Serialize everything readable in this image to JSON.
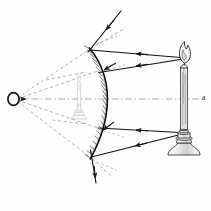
{
  "figure": {
    "background_color": "#fefefe",
    "ink_color": "#1a1a1a",
    "construction_color": "#8a8a8a",
    "ghost_color": "#b9b9b9"
  },
  "labels": {
    "axis_right": "a",
    "convergence_point": "O"
  },
  "objects": {
    "candle": {
      "name": "candle",
      "position": "right",
      "flame": {
        "center_x": 184,
        "center_y": 54
      },
      "body": {
        "top_y": 62,
        "bottom_y": 132,
        "center_x": 184
      },
      "holder": {
        "top_y": 130,
        "bottom_y": 155,
        "center_x": 184
      }
    },
    "mirror": {
      "name": "concave-mirror",
      "type": "concave",
      "vertex": {
        "x": 110,
        "y": 99
      },
      "top_edge": {
        "x": 89,
        "y": 48
      },
      "bottom_edge": {
        "x": 90,
        "y": 160
      },
      "hatching": "back-surface"
    },
    "image": {
      "name": "inverted-candle-image",
      "orientation": "inverted",
      "center_x": 79,
      "top_y": 70,
      "bottom_y": 120
    },
    "focus_point": {
      "x": 14,
      "y": 99
    }
  },
  "rays": {
    "incident_upper": {
      "from_x": 181,
      "from_y": 58,
      "to_x": 90,
      "to_y": 50
    },
    "incident_lower_upper": {
      "from_x": 181,
      "from_y": 60,
      "to_x": 98,
      "to_y": 72
    },
    "incident_lower": {
      "from_x": 180,
      "from_y": 133,
      "to_x": 97,
      "to_y": 127
    },
    "incident_bottom": {
      "from_x": 181,
      "from_y": 135,
      "to_x": 91,
      "to_y": 157
    },
    "external_top": {
      "from_x": 121,
      "from_y": 10,
      "to_x": 88,
      "to_y": 52
    },
    "external_bottom": {
      "from_x": 96,
      "from_y": 182,
      "to_x": 90,
      "to_y": 151
    }
  },
  "axis": {
    "name": "optical-axis",
    "style": "dash-dot",
    "y": 99,
    "from_x": 18,
    "to_x": 207
  }
}
